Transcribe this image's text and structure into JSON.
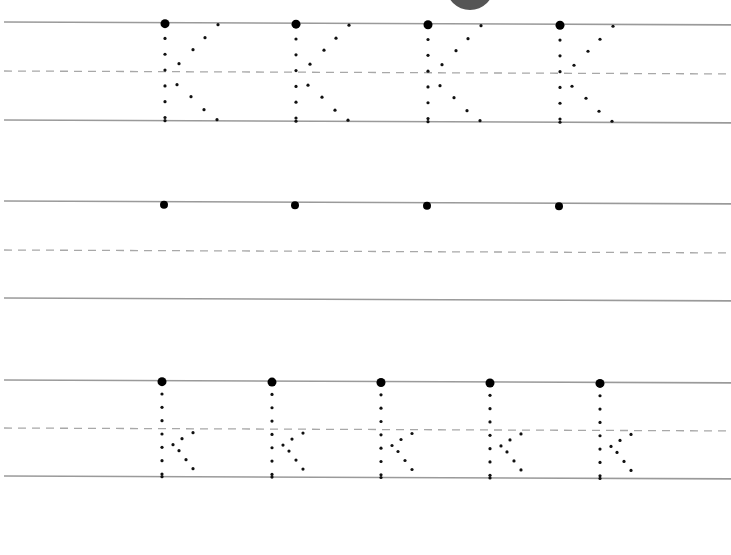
{
  "worksheet": {
    "letter_upper": "K",
    "letter_lower": "k",
    "colors": {
      "line": "#9a9a9a",
      "dash": "#a8a8a8",
      "dot": "#111111",
      "corner_circle": "#555555"
    },
    "corner_circle": {
      "cx": 470,
      "cy": -14,
      "r": 24
    },
    "rows": [
      {
        "name": "uppercase-trace-row",
        "top": 22,
        "mid": 71,
        "bottom": 120,
        "slope": 0.004,
        "letters": [
          {
            "type": "K",
            "x": 165
          },
          {
            "type": "K",
            "x": 296
          },
          {
            "type": "K",
            "x": 428
          },
          {
            "type": "K",
            "x": 560
          }
        ]
      },
      {
        "name": "uppercase-practice-row",
        "top": 201,
        "mid": 250,
        "bottom": 298,
        "slope": 0.004,
        "letters": [
          {
            "type": "start",
            "x": 164
          },
          {
            "type": "start",
            "x": 295
          },
          {
            "type": "start",
            "x": 427
          },
          {
            "type": "start",
            "x": 559
          }
        ]
      },
      {
        "name": "lowercase-trace-row",
        "top": 380,
        "mid": 428,
        "bottom": 476,
        "slope": 0.004,
        "letters": [
          {
            "type": "k",
            "x": 162
          },
          {
            "type": "k",
            "x": 272
          },
          {
            "type": "k",
            "x": 381
          },
          {
            "type": "k",
            "x": 490
          },
          {
            "type": "k",
            "x": 600
          }
        ]
      }
    ]
  }
}
